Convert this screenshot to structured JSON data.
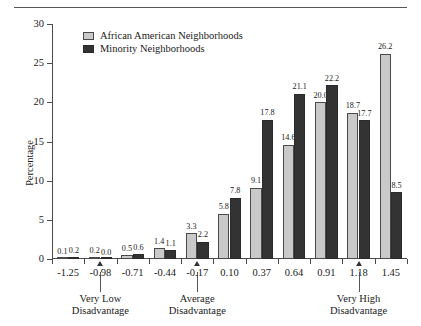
{
  "figure": {
    "top_rule_fragment": "",
    "y_axis_title": "Percentage"
  },
  "legend": {
    "position": "top-left-inside",
    "entries": [
      {
        "label": "African American Neighborhoods",
        "swatch": "light-gray-square-icon",
        "color": "#c9c9c9"
      },
      {
        "label": "Minority Neighborhoods",
        "swatch": "dark-square-icon",
        "color": "#333333"
      }
    ]
  },
  "annotations": [
    {
      "label_line1": "Very Low",
      "label_line2": "Disadvantage",
      "at_category": "-0.98"
    },
    {
      "label_line1": "Average",
      "label_line2": "Disadvantage",
      "at_category": "-0.17"
    },
    {
      "label_line1": "Very High",
      "label_line2": "Disadvantage",
      "at_category": "1.18"
    }
  ],
  "chart_data": {
    "type": "bar",
    "title": "",
    "xlabel": "",
    "ylabel": "Percentage",
    "categories": [
      "-1.25",
      "-0.98",
      "-0.71",
      "-0.44",
      "-0.17",
      "0.10",
      "0.37",
      "0.64",
      "0.91",
      "1.18",
      "1.45"
    ],
    "series": [
      {
        "name": "African American Neighborhoods",
        "color": "#c9c9c9",
        "values": [
          0.1,
          0.2,
          0.5,
          1.4,
          3.3,
          5.8,
          9.1,
          14.6,
          20.0,
          18.7,
          26.2
        ]
      },
      {
        "name": "Minority Neighborhoods",
        "color": "#333333",
        "values": [
          0.2,
          0.0,
          0.6,
          1.1,
          2.2,
          7.8,
          17.8,
          21.1,
          22.2,
          17.7,
          8.5
        ]
      }
    ],
    "ylim": [
      0,
      30
    ],
    "yticks": [
      0,
      5,
      10,
      15,
      20,
      25,
      30
    ],
    "grid": false,
    "legend_position": "upper left",
    "value_labels": true
  }
}
